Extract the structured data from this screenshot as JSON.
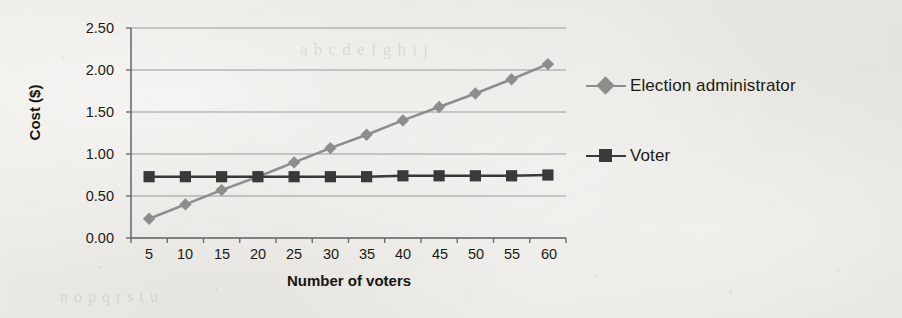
{
  "chart_data": {
    "type": "line",
    "title": "",
    "xlabel": "Number of voters",
    "ylabel": "Cost ($)",
    "x": [
      5,
      10,
      15,
      20,
      25,
      30,
      35,
      40,
      45,
      50,
      55,
      60
    ],
    "xtick_labels": [
      "5",
      "10",
      "15",
      "20",
      "25",
      "30",
      "35",
      "40",
      "45",
      "50",
      "55",
      "60"
    ],
    "ytick_labels": [
      "0.00",
      "0.50",
      "1.00",
      "1.50",
      "2.00",
      "2.50"
    ],
    "ylim": [
      0.0,
      2.5
    ],
    "ytick_step": 0.5,
    "grid": "horizontal",
    "legend_position": "right",
    "series": [
      {
        "name": "Election administrator",
        "marker": "diamond",
        "color": "#8d8d8d",
        "values": [
          0.23,
          0.4,
          0.57,
          0.73,
          0.9,
          1.07,
          1.23,
          1.4,
          1.56,
          1.72,
          1.89,
          2.07
        ]
      },
      {
        "name": "Voter",
        "marker": "square",
        "color": "#3a3a3a",
        "values": [
          0.73,
          0.73,
          0.73,
          0.73,
          0.73,
          0.73,
          0.73,
          0.74,
          0.74,
          0.74,
          0.74,
          0.75
        ]
      }
    ]
  },
  "colors": {
    "page_background": "#e9e7e2",
    "axis": "#6d6d6d",
    "gridline": "#8b8b8b",
    "text": "#1b1a14",
    "series_election_administrator": "#8d8d8d",
    "series_voter": "#3a3a3a"
  },
  "legend": {
    "items": [
      {
        "label": "Election administrator"
      },
      {
        "label": "Voter"
      }
    ]
  },
  "bleed_through": {
    "line1": "a b c d e f g h i j",
    "line2": "n o p q r s t u"
  }
}
